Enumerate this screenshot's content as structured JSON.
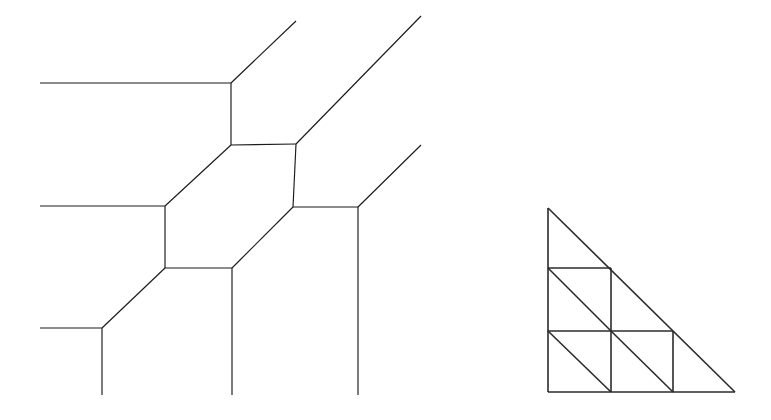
{
  "figure": {
    "background_color": "#ffffff",
    "stroke_color": "#1a1a1a",
    "mesh_stroke_color": "#2b2b2b",
    "width": 771,
    "height": 420
  },
  "chart_data": {
    "type": "diagram",
    "xlabel": "",
    "ylabel": "",
    "xlim": [
      0,
      771
    ],
    "ylim": [
      0,
      420
    ],
    "grid": false,
    "legend": "none",
    "panels": [
      {
        "name": "hexagonal-graph",
        "label": "Hexagonal trivalent graph (left panel)",
        "nodes": [
          {
            "id": "h1",
            "x": 231,
            "y": 145,
            "degree": 3
          },
          {
            "id": "h2",
            "x": 296,
            "y": 144,
            "degree": 3
          },
          {
            "id": "h3",
            "x": 293,
            "y": 207,
            "degree": 3
          },
          {
            "id": "h4",
            "x": 232,
            "y": 268,
            "degree": 3
          },
          {
            "id": "h5",
            "x": 165,
            "y": 268,
            "degree": 3
          },
          {
            "id": "h6",
            "x": 165,
            "y": 206,
            "degree": 3
          },
          {
            "id": "t1",
            "x": 231,
            "y": 83,
            "degree": 3
          },
          {
            "id": "t2",
            "x": 102,
            "y": 328,
            "degree": 3
          }
        ],
        "hexagon_cycle": [
          "h1",
          "h2",
          "h3",
          "h4",
          "h5",
          "h6"
        ],
        "edges": [
          {
            "from": [
              231,
              145
            ],
            "to": [
              296,
              144
            ],
            "kind": "hexagon"
          },
          {
            "from": [
              296,
              144
            ],
            "to": [
              293,
              207
            ],
            "kind": "hexagon"
          },
          {
            "from": [
              293,
              207
            ],
            "to": [
              232,
              268
            ],
            "kind": "hexagon"
          },
          {
            "from": [
              232,
              268
            ],
            "to": [
              165,
              268
            ],
            "kind": "hexagon"
          },
          {
            "from": [
              165,
              268
            ],
            "to": [
              165,
              206
            ],
            "kind": "hexagon"
          },
          {
            "from": [
              165,
              206
            ],
            "to": [
              231,
              145
            ],
            "kind": "hexagon"
          },
          {
            "from": [
              231,
              145
            ],
            "to": [
              231,
              83
            ],
            "kind": "spur"
          },
          {
            "from": [
              231,
              83
            ],
            "to": [
              40,
              83
            ],
            "kind": "spur"
          },
          {
            "from": [
              231,
              83
            ],
            "to": [
              296,
              21
            ],
            "kind": "spur"
          },
          {
            "from": [
              296,
              144
            ],
            "to": [
              421,
              16
            ],
            "kind": "spur"
          },
          {
            "from": [
              293,
              207
            ],
            "to": [
              358,
              207
            ],
            "kind": "spur"
          },
          {
            "from": [
              358,
              207
            ],
            "to": [
              421,
              145
            ],
            "kind": "spur"
          },
          {
            "from": [
              358,
              207
            ],
            "to": [
              358,
              395
            ],
            "kind": "spur"
          },
          {
            "from": [
              232,
              268
            ],
            "to": [
              232,
              395
            ],
            "kind": "spur"
          },
          {
            "from": [
              165,
              268
            ],
            "to": [
              102,
              328
            ],
            "kind": "spur"
          },
          {
            "from": [
              102,
              328
            ],
            "to": [
              40,
              328
            ],
            "kind": "spur"
          },
          {
            "from": [
              102,
              328
            ],
            "to": [
              102,
              395
            ],
            "kind": "spur"
          },
          {
            "from": [
              165,
              206
            ],
            "to": [
              40,
              206
            ],
            "kind": "spur"
          }
        ]
      },
      {
        "name": "triangular-mesh",
        "label": "Right triangular mesh (right panel)",
        "triangle_outline": [
          [
            548,
            208
          ],
          [
            548,
            392
          ],
          [
            735,
            392
          ]
        ],
        "grid_spacing": 62,
        "edges": [
          {
            "from": [
              548,
              208
            ],
            "to": [
              548,
              392
            ],
            "kind": "outline"
          },
          {
            "from": [
              548,
              392
            ],
            "to": [
              735,
              392
            ],
            "kind": "outline"
          },
          {
            "from": [
              735,
              392
            ],
            "to": [
              548,
              208
            ],
            "kind": "hypotenuse"
          },
          {
            "from": [
              548,
              268
            ],
            "to": [
              611,
              268
            ],
            "kind": "grid-horizontal"
          },
          {
            "from": [
              548,
              331
            ],
            "to": [
              673,
              331
            ],
            "kind": "grid-horizontal"
          },
          {
            "from": [
              611,
              268
            ],
            "to": [
              611,
              392
            ],
            "kind": "grid-vertical"
          },
          {
            "from": [
              673,
              331
            ],
            "to": [
              673,
              392
            ],
            "kind": "grid-vertical"
          },
          {
            "from": [
              548,
              268
            ],
            "to": [
              611,
              331
            ],
            "kind": "diagonal"
          },
          {
            "from": [
              548,
              331
            ],
            "to": [
              611,
              392
            ],
            "kind": "diagonal"
          },
          {
            "from": [
              611,
              331
            ],
            "to": [
              673,
              392
            ],
            "kind": "diagonal"
          }
        ],
        "cells": [
          {
            "type": "triangle",
            "vertices": [
              [
                548,
                208
              ],
              [
                548,
                268
              ],
              [
                611,
                268
              ]
            ]
          },
          {
            "type": "triangle",
            "vertices": [
              [
                548,
                268
              ],
              [
                548,
                331
              ],
              [
                611,
                331
              ]
            ]
          },
          {
            "type": "triangle",
            "vertices": [
              [
                548,
                268
              ],
              [
                611,
                268
              ],
              [
                611,
                331
              ]
            ]
          },
          {
            "type": "triangle",
            "vertices": [
              [
                548,
                331
              ],
              [
                548,
                392
              ],
              [
                611,
                392
              ]
            ]
          },
          {
            "type": "triangle",
            "vertices": [
              [
                548,
                331
              ],
              [
                611,
                331
              ],
              [
                611,
                392
              ]
            ]
          },
          {
            "type": "triangle",
            "vertices": [
              [
                611,
                331
              ],
              [
                611,
                392
              ],
              [
                673,
                392
              ]
            ]
          },
          {
            "type": "triangle",
            "vertices": [
              [
                611,
                331
              ],
              [
                673,
                331
              ],
              [
                673,
                392
              ]
            ]
          },
          {
            "type": "triangle",
            "vertices": [
              [
                673,
                331
              ],
              [
                673,
                392
              ],
              [
                735,
                392
              ]
            ]
          },
          {
            "type": "triangle",
            "vertices": [
              [
                611,
                268
              ],
              [
                611,
                331
              ],
              [
                673,
                331
              ]
            ]
          }
        ]
      }
    ]
  }
}
